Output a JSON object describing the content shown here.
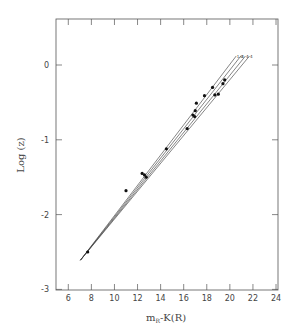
{
  "chart_data": {
    "type": "scatter",
    "title": "",
    "xlabel": "m_R-K(R)",
    "xlabel_main": "m",
    "xlabel_sub": "R",
    "xlabel_rest": "-K(R)",
    "ylabel": "Log (z)",
    "xlim": [
      5,
      24
    ],
    "ylim": [
      -3,
      0.75
    ],
    "xticks": [
      6,
      8,
      10,
      12,
      14,
      16,
      18,
      20,
      22,
      24
    ],
    "yticks": [
      0,
      -1,
      -2,
      -3
    ],
    "grid": false,
    "legend": null,
    "points": [
      {
        "x": 7.68,
        "y": -2.5
      },
      {
        "x": 11.0,
        "y": -1.68
      },
      {
        "x": 12.4,
        "y": -1.45
      },
      {
        "x": 12.6,
        "y": -1.47
      },
      {
        "x": 12.75,
        "y": -1.5
      },
      {
        "x": 14.5,
        "y": -1.12
      },
      {
        "x": 16.3,
        "y": -0.85
      },
      {
        "x": 16.8,
        "y": -0.67
      },
      {
        "x": 16.95,
        "y": -0.69
      },
      {
        "x": 17.0,
        "y": -0.61
      },
      {
        "x": 17.1,
        "y": -0.51
      },
      {
        "x": 17.8,
        "y": -0.41
      },
      {
        "x": 18.5,
        "y": -0.3
      },
      {
        "x": 18.7,
        "y": -0.4
      },
      {
        "x": 19.0,
        "y": -0.39
      },
      {
        "x": 19.4,
        "y": -0.25
      },
      {
        "x": 19.55,
        "y": -0.2
      }
    ],
    "series": [
      {
        "name": "1.0",
        "x": [
          7.05,
          20.55
        ],
        "y": [
          -2.61,
          0.12
        ]
      },
      {
        "name": "line-2",
        "x": [
          7.05,
          20.95
        ],
        "y": [
          -2.61,
          0.12
        ]
      },
      {
        "name": "line-3",
        "x": [
          7.05,
          21.35
        ],
        "y": [
          -2.61,
          0.12
        ]
      },
      {
        "name": "line-4",
        "x": [
          7.05,
          21.7
        ],
        "y": [
          -2.61,
          0.12
        ]
      }
    ],
    "line_labels": [
      "1.0",
      "4",
      "4",
      "4"
    ]
  }
}
